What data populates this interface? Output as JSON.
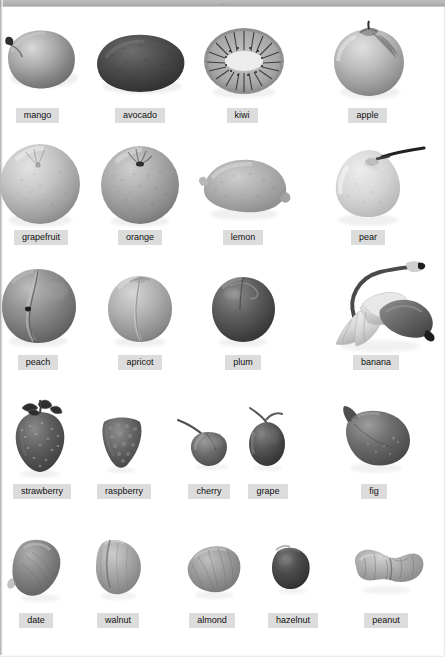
{
  "page": {
    "header_mark": "...",
    "background_color": "#ffffff",
    "label_background_color": "#dcdcdc",
    "label_text_color": "#111111",
    "header_band_color": "#b2b2b2"
  },
  "rows": [
    {
      "row_index": 1,
      "items": [
        {
          "label": "mango",
          "icon": "mango-icon",
          "x": 0,
          "w": 100,
          "art_w": 80,
          "art_h": 68,
          "cx": 42,
          "cy": 62,
          "label_cx": 37
        },
        {
          "label": "avocado",
          "icon": "avocado-icon",
          "x": 96,
          "w": 110,
          "art_w": 100,
          "art_h": 68,
          "cx": 142,
          "cy": 62,
          "label_cx": 140
        },
        {
          "label": "kiwi",
          "icon": "kiwi-icon",
          "x": 200,
          "w": 100,
          "art_w": 86,
          "art_h": 70,
          "cx": 243,
          "cy": 62,
          "label_cx": 242
        },
        {
          "label": "apple",
          "icon": "apple-icon",
          "x": 320,
          "w": 115,
          "art_w": 82,
          "art_h": 76,
          "cx": 368,
          "cy": 64,
          "label_cx": 367
        }
      ]
    },
    {
      "row_index": 2,
      "items": [
        {
          "label": "grapefruit",
          "icon": "grapefruit-icon",
          "x": 0,
          "w": 100,
          "art_w": 86,
          "art_h": 86,
          "cx": 40,
          "cy": 183,
          "label_cx": 40
        },
        {
          "label": "orange",
          "icon": "orange-icon",
          "x": 96,
          "w": 110,
          "art_w": 84,
          "art_h": 84,
          "cx": 140,
          "cy": 183,
          "label_cx": 140
        },
        {
          "label": "lemon",
          "icon": "lemon-icon",
          "x": 200,
          "w": 100,
          "art_w": 94,
          "art_h": 66,
          "cx": 243,
          "cy": 186,
          "label_cx": 243
        },
        {
          "label": "pear",
          "icon": "pear-icon",
          "x": 320,
          "w": 115,
          "art_w": 96,
          "art_h": 84,
          "cx": 368,
          "cy": 184,
          "label_cx": 368
        }
      ]
    },
    {
      "row_index": 3,
      "items": [
        {
          "label": "peach",
          "icon": "peach-icon",
          "x": 0,
          "w": 100,
          "art_w": 82,
          "art_h": 80,
          "cx": 38,
          "cy": 305,
          "label_cx": 38
        },
        {
          "label": "apricot",
          "icon": "apricot-icon",
          "x": 96,
          "w": 110,
          "art_w": 70,
          "art_h": 70,
          "cx": 140,
          "cy": 308,
          "label_cx": 140
        },
        {
          "label": "plum",
          "icon": "plum-icon",
          "x": 200,
          "w": 100,
          "art_w": 66,
          "art_h": 68,
          "cx": 243,
          "cy": 309,
          "label_cx": 243
        },
        {
          "label": "banana",
          "icon": "banana-icon",
          "x": 320,
          "w": 122,
          "art_w": 118,
          "art_h": 92,
          "cx": 382,
          "cy": 305,
          "label_cx": 378
        }
      ]
    },
    {
      "row_index": 4,
      "items": [
        {
          "label": "strawberry",
          "icon": "strawberry-icon",
          "x": 0,
          "w": 90,
          "art_w": 56,
          "art_h": 72,
          "cx": 40,
          "cy": 438,
          "label_cx": 42
        },
        {
          "label": "raspberry",
          "icon": "raspberry-icon",
          "x": 80,
          "w": 90,
          "art_w": 44,
          "art_h": 54,
          "cx": 120,
          "cy": 443,
          "label_cx": 120
        },
        {
          "label": "cherry",
          "icon": "cherry-icon",
          "x": 170,
          "w": 80,
          "art_w": 48,
          "art_h": 50,
          "cx": 208,
          "cy": 445,
          "label_cx": 208
        },
        {
          "label": "grape",
          "icon": "grape-icon",
          "x": 240,
          "w": 80,
          "art_w": 40,
          "art_h": 56,
          "cx": 265,
          "cy": 443,
          "label_cx": 265
        },
        {
          "label": "fig",
          "icon": "fig-icon",
          "x": 320,
          "w": 120,
          "art_w": 74,
          "art_h": 62,
          "cx": 375,
          "cy": 440,
          "label_cx": 375
        }
      ]
    },
    {
      "row_index": 5,
      "items": [
        {
          "label": "date",
          "icon": "date-icon",
          "x": 0,
          "w": 90,
          "art_w": 56,
          "art_h": 60,
          "cx": 38,
          "cy": 570,
          "label_cx": 38
        },
        {
          "label": "walnut",
          "icon": "walnut-icon",
          "x": 80,
          "w": 90,
          "art_w": 52,
          "art_h": 56,
          "cx": 117,
          "cy": 570,
          "label_cx": 117
        },
        {
          "label": "almond",
          "icon": "almond-icon",
          "x": 170,
          "w": 90,
          "art_w": 58,
          "art_h": 50,
          "cx": 212,
          "cy": 572,
          "label_cx": 212
        },
        {
          "label": "hazelnut",
          "icon": "hazelnut-icon",
          "x": 255,
          "w": 80,
          "art_w": 40,
          "art_h": 42,
          "cx": 290,
          "cy": 574,
          "label_cx": 290
        },
        {
          "label": "peanut",
          "icon": "peanut-icon",
          "x": 335,
          "w": 105,
          "art_w": 66,
          "art_h": 42,
          "cx": 386,
          "cy": 572,
          "label_cx": 385
        }
      ]
    }
  ],
  "label_y": [
    110,
    232,
    357,
    486,
    615
  ],
  "items_flat": [
    "mango",
    "avocado",
    "kiwi",
    "apple",
    "grapefruit",
    "orange",
    "lemon",
    "pear",
    "peach",
    "apricot",
    "plum",
    "banana",
    "strawberry",
    "raspberry",
    "cherry",
    "grape",
    "fig",
    "date",
    "walnut",
    "almond",
    "hazelnut",
    "peanut"
  ]
}
